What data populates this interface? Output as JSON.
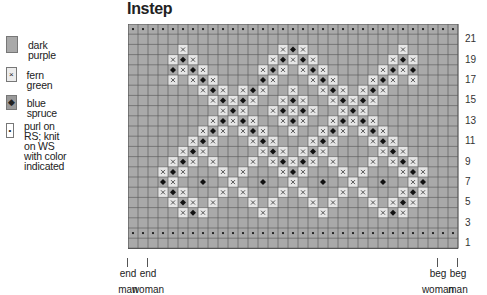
{
  "title": "Instep",
  "colors": {
    "dark_purple": "#a9a9a9",
    "fern_green": "#e6e6e6",
    "blue_spruce": "#9a9a9a",
    "grid_line": "#555555",
    "symbol": "#111111"
  },
  "legend": [
    {
      "symbol": "dark-purple",
      "glyph": "",
      "label": "dark purple"
    },
    {
      "symbol": "fern-green",
      "glyph": "×",
      "label": "fern green"
    },
    {
      "symbol": "blue-spruce",
      "glyph": "◆",
      "label": "blue spruce"
    },
    {
      "symbol": "purl",
      "glyph": "•",
      "label": "purl on RS; knit on WS\nwith color indicated"
    }
  ],
  "chart": {
    "columns": 33,
    "rows": 22,
    "row_labels": [
      "21",
      "19",
      "17",
      "15",
      "13",
      "11",
      "9",
      "7",
      "5",
      "3",
      "1"
    ],
    "purl_rows": [
      2,
      22
    ],
    "pattern": {
      "20": {
        "x": [
          5,
          15,
          17,
          27
        ],
        "d": [
          16
        ]
      },
      "19": {
        "x": [
          4,
          6,
          14,
          16,
          18,
          26,
          28
        ],
        "d": [
          5,
          15,
          17,
          27
        ]
      },
      "18": {
        "x": [
          5,
          7,
          13,
          15,
          17,
          19,
          25,
          27
        ],
        "d": [
          4,
          6,
          14,
          18,
          26,
          28
        ]
      },
      "17": {
        "x": [
          4,
          6,
          8,
          14,
          18,
          20,
          24,
          26,
          28
        ],
        "d": [
          7,
          13,
          19,
          25
        ]
      },
      "16": {
        "x": [
          7,
          9,
          11,
          13,
          16,
          19,
          21,
          23,
          25
        ],
        "d": [
          8,
          12,
          20,
          24
        ]
      },
      "15": {
        "x": [
          8,
          10,
          12,
          15,
          17,
          20,
          22,
          24
        ],
        "d": [
          9,
          11,
          16,
          21,
          23
        ]
      },
      "14": {
        "x": [
          9,
          11,
          14,
          16,
          18,
          21,
          23
        ],
        "d": [
          10,
          15,
          17,
          22
        ]
      },
      "13": {
        "x": [
          8,
          10,
          12,
          15,
          17,
          20,
          22,
          24
        ],
        "d": [
          9,
          11,
          16,
          21,
          23
        ]
      },
      "12": {
        "x": [
          7,
          9,
          11,
          13,
          16,
          19,
          21,
          23,
          25
        ],
        "d": [
          8,
          12,
          20,
          24
        ]
      },
      "11": {
        "x": [
          6,
          8,
          12,
          14,
          18,
          20,
          24,
          26
        ],
        "d": [
          7,
          13,
          19,
          25
        ]
      },
      "10": {
        "x": [
          5,
          7,
          13,
          15,
          17,
          19,
          25,
          27
        ],
        "d": [
          6,
          14,
          18,
          26
        ]
      },
      "9": {
        "x": [
          4,
          6,
          8,
          12,
          14,
          16,
          18,
          20,
          24,
          26,
          28
        ],
        "d": [
          5,
          15,
          17,
          27
        ]
      },
      "8": {
        "x": [
          3,
          5,
          9,
          11,
          15,
          17,
          21,
          23,
          27,
          29
        ],
        "d": [
          4,
          16,
          28
        ]
      },
      "7": {
        "x": [
          4,
          10,
          16,
          22,
          28
        ],
        "d": [
          3,
          7,
          13,
          19,
          25,
          29
        ]
      },
      "6": {
        "x": [
          3,
          5,
          9,
          11,
          15,
          17,
          21,
          23,
          27,
          29
        ],
        "d": [
          4,
          28
        ]
      },
      "5": {
        "x": [
          4,
          6,
          8,
          12,
          14,
          18,
          20,
          24,
          26,
          28
        ],
        "d": [
          5,
          27
        ]
      },
      "4": {
        "x": [
          5,
          7,
          13,
          19,
          25,
          27
        ],
        "d": [
          6,
          26
        ]
      }
    }
  },
  "markers": [
    {
      "id": "end-man",
      "line1": "end",
      "line2": "man",
      "col_edge": 0
    },
    {
      "id": "end-woman",
      "line1": "end",
      "line2": "woman",
      "col_edge": 2
    },
    {
      "id": "beg-woman",
      "line1": "beg",
      "line2": "woman",
      "col_edge": 31
    },
    {
      "id": "beg-man",
      "line1": "beg",
      "line2": "man",
      "col_edge": 33
    }
  ]
}
